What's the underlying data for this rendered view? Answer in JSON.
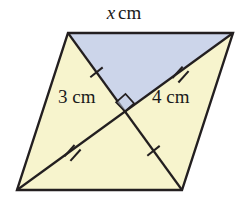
{
  "figure": {
    "type": "geometry-diagram",
    "shape_name": "parallelogram",
    "canvas": {
      "width": 248,
      "height": 199,
      "background": "#ffffff"
    },
    "colors": {
      "fill_yellow": "#f7f4cd",
      "fill_blue": "#ccd5ea",
      "stroke": "#231f20",
      "label_text": "#1a1a1a"
    },
    "vertices": {
      "top_left": {
        "x": 68,
        "y": 33
      },
      "top_right": {
        "x": 233,
        "y": 33
      },
      "bottom_right": {
        "x": 182,
        "y": 190
      },
      "bottom_left": {
        "x": 17,
        "y": 190
      },
      "center": {
        "x": 125,
        "y": 111.5
      }
    },
    "labels": {
      "top_side": {
        "variable": "x",
        "unit": "cm"
      },
      "left_half_diagonal": "3 cm",
      "right_half_diagonal": "4 cm"
    },
    "markers": {
      "right_angle": {
        "name": "right-angle-marker",
        "at": {
          "x": 125,
          "y": 111.5
        },
        "size": 13,
        "opens_toward": "top"
      },
      "tick_marks": [
        {
          "name": "tick-upper-left",
          "segment": "top-left-to-center",
          "count": 1,
          "at": {
            "x": 96.5,
            "y": 72.3
          }
        },
        {
          "name": "tick-lower-right",
          "segment": "center-to-bottom-right",
          "count": 1,
          "at": {
            "x": 153.5,
            "y": 150.8
          }
        },
        {
          "name": "tick-upper-right",
          "segment": "top-right-to-center",
          "count": 2,
          "at": {
            "x": 179,
            "y": 72.3
          }
        },
        {
          "name": "tick-lower-left",
          "segment": "center-to-bottom-left",
          "count": 2,
          "at": {
            "x": 71,
            "y": 150.8
          }
        }
      ]
    },
    "regions": [
      {
        "name": "region-top-triangle",
        "fill": "#ccd5ea",
        "points": "68,33 233,33 125,111.5"
      },
      {
        "name": "region-left-triangle",
        "fill": "#f7f4cd",
        "points": "68,33 125,111.5 17,190"
      },
      {
        "name": "region-right-triangle",
        "fill": "#f7f4cd",
        "points": "233,33 182,190 125,111.5"
      },
      {
        "name": "region-bottom-triangle",
        "fill": "#f7f4cd",
        "points": "17,190 125,111.5 182,190"
      }
    ]
  }
}
